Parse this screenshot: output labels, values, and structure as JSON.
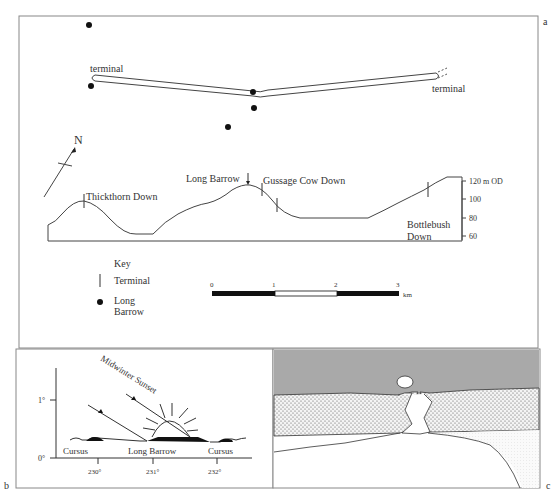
{
  "panels": {
    "a": {
      "letter": "a",
      "plan": {
        "terminal_west": "terminal",
        "terminal_east": "terminal",
        "north": "N"
      },
      "profile": {
        "labels": {
          "thickthorn": "Thickthorn Down",
          "long_barrow": "Long Barrow",
          "gussage": "Gussage Cow Down",
          "bottlebush_1": "Bottlebush",
          "bottlebush_2": "Down"
        },
        "axis": {
          "ticks": [
            "120 m OD",
            "100",
            "80",
            "60"
          ]
        }
      },
      "key": {
        "title": "Key",
        "terminal": "Terminal",
        "long_barrow_1": "Long",
        "long_barrow_2": "Barrow"
      },
      "scale": {
        "ticks": [
          "0",
          "1",
          "2",
          "3"
        ],
        "unit": "km"
      }
    },
    "b": {
      "letter": "b",
      "title": "Midwinter Sunset",
      "y_ticks": [
        "1°",
        "0°"
      ],
      "x_ticks": [
        "230°",
        "231°",
        "232°"
      ],
      "labels": {
        "cursus_left": "Cursus",
        "long_barrow": "Long Barrow",
        "cursus_right": "Cursus"
      }
    },
    "c": {
      "letter": "c"
    }
  },
  "colors": {
    "sky": "#a9a9a9",
    "line": "#333333",
    "stipple": "#555555"
  }
}
